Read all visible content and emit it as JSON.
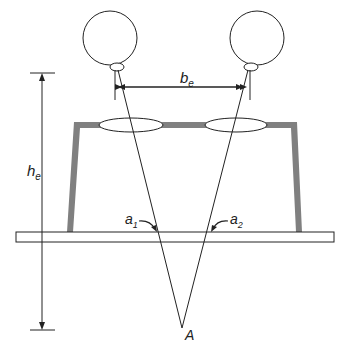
{
  "diagram": {
    "labels": {
      "baseline_main": "b",
      "baseline_sub": "e",
      "height_main": "h",
      "height_sub": "e",
      "angle1_main": "a",
      "angle1_sub": "1",
      "angle2_main": "a",
      "angle2_sub": "2",
      "point": "A"
    },
    "components": [
      {
        "name": "left-eye",
        "type": "circle"
      },
      {
        "name": "right-eye",
        "type": "circle"
      },
      {
        "name": "left-lens",
        "type": "ellipse"
      },
      {
        "name": "right-lens",
        "type": "ellipse"
      },
      {
        "name": "stereoscope-frame",
        "type": "frame"
      },
      {
        "name": "photo-plane",
        "type": "rectangle"
      },
      {
        "name": "eye-base-dimension",
        "type": "dimension-line"
      },
      {
        "name": "viewing-distance-dimension",
        "type": "dimension-line"
      },
      {
        "name": "sight-ray-left",
        "type": "line"
      },
      {
        "name": "sight-ray-right",
        "type": "line"
      }
    ],
    "colors": {
      "stroke": "#222222",
      "frame": "#808080",
      "background": "#ffffff"
    }
  }
}
